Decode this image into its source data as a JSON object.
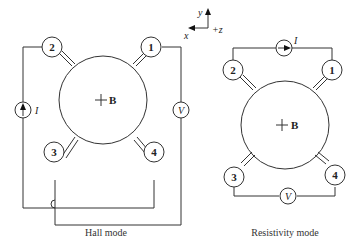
{
  "axes": {
    "x": "x",
    "y": "y",
    "z": "+z"
  },
  "hall": {
    "caption": "Hall mode",
    "field_label": "B",
    "contacts": [
      "1",
      "2",
      "3",
      "4"
    ],
    "current_label": "I",
    "voltage_label": "V"
  },
  "resistivity": {
    "caption": "Resistivity mode",
    "field_label": "B",
    "contacts": [
      "1",
      "2",
      "3",
      "4"
    ],
    "current_label": "I",
    "voltage_label": "V"
  }
}
